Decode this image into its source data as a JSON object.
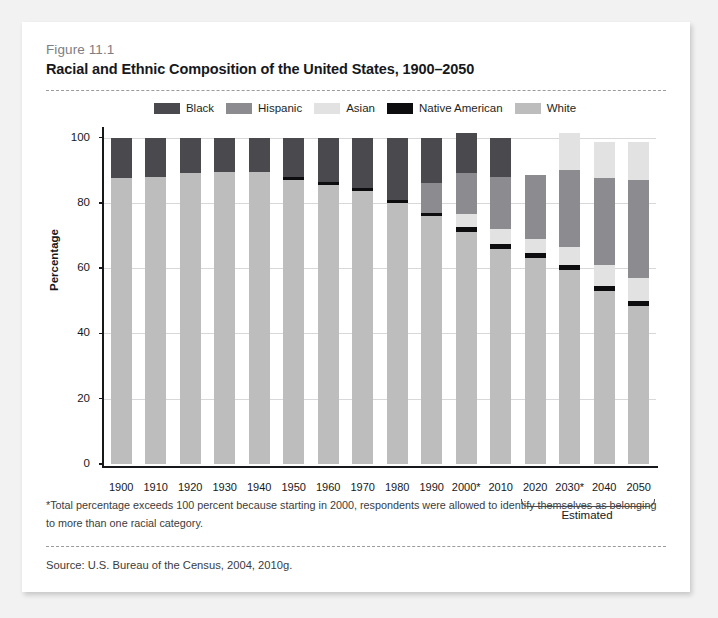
{
  "figure": {
    "number": "Figure 11.1",
    "title": "Racial and Ethnic Composition of the United States, 1900–2050"
  },
  "notes": {
    "footnote": "*Total percentage exceeds 100 percent because starting in 2000, respondents were allowed to identify themselves as belonging to more than one racial category.",
    "source": "Source: U.S. Bureau of the Census, 2004, 2010g."
  },
  "annotations": {
    "estimated_label": "Estimated"
  },
  "colors": {
    "black": "#4a4a4e",
    "hispanic": "#8c8c90",
    "asian": "#e2e2e2",
    "native_american": "#0d0d0f",
    "white": "#bdbdbd",
    "axis": "#16181c",
    "grid": "#d8d8da",
    "page_bg": "#f2f2f2",
    "card_bg": "#ffffff"
  },
  "chart_data": {
    "type": "bar",
    "stacked": true,
    "title": "Racial and Ethnic Composition of the United States, 1900–2050",
    "xlabel": "",
    "ylabel": "Percentage",
    "ylim": [
      0,
      100
    ],
    "yticks": [
      0,
      20,
      40,
      60,
      80,
      100
    ],
    "ytick_labels": [
      "0",
      "20",
      "40",
      "60",
      "80",
      "100"
    ],
    "grid": true,
    "legend_position": "top-center",
    "categories": [
      "1900",
      "1910",
      "1920",
      "1930",
      "1940",
      "1950",
      "1960",
      "1970",
      "1980",
      "1990",
      "2000*",
      "2010",
      "2020",
      "2030*",
      "2040",
      "2050"
    ],
    "estimated_categories": [
      "2020",
      "2030*",
      "2040",
      "2050"
    ],
    "series": [
      {
        "name": "White",
        "color": "#bdbdbd",
        "values": [
          87.5,
          88.0,
          89.0,
          89.5,
          89.5,
          87.0,
          85.5,
          83.5,
          80.0,
          76.0,
          71.0,
          66.0,
          63.0,
          59.5,
          53.0,
          48.5
        ]
      },
      {
        "name": "Native American",
        "color": "#0d0d0f",
        "values": [
          0,
          0,
          0,
          0,
          0,
          1.0,
          1.0,
          1.0,
          1.0,
          1.0,
          1.5,
          1.5,
          1.5,
          1.5,
          1.5,
          1.5
        ]
      },
      {
        "name": "Asian",
        "color": "#e2e2e2",
        "values": [
          0,
          0,
          0,
          0,
          0,
          0,
          0,
          0,
          0,
          0,
          4.0,
          4.5,
          4.5,
          5.5,
          6.5,
          7.0
        ]
      },
      {
        "name": "Hispanic",
        "color": "#8c8c90",
        "values": [
          0,
          0,
          0,
          0,
          0,
          0,
          0,
          0,
          0,
          9.0,
          12.5,
          16.0,
          19.5,
          23.5,
          26.5,
          30.0
        ]
      },
      {
        "name": "Black",
        "color": "#4a4a4e",
        "values": [
          12.5,
          12.0,
          11.0,
          10.5,
          10.5,
          12.0,
          13.5,
          15.5,
          19.0,
          14.0,
          12.5,
          12.0,
          0,
          0,
          0,
          0
        ]
      }
    ],
    "bars": [
      {
        "label": "1900",
        "total": 100.0,
        "estimated": false,
        "segments": [
          {
            "name": "White",
            "value": 87.5
          },
          {
            "name": "Black",
            "value": 12.5
          }
        ]
      },
      {
        "label": "1910",
        "total": 100.0,
        "estimated": false,
        "segments": [
          {
            "name": "White",
            "value": 88.0
          },
          {
            "name": "Black",
            "value": 12.0
          }
        ]
      },
      {
        "label": "1920",
        "total": 100.0,
        "estimated": false,
        "segments": [
          {
            "name": "White",
            "value": 89.0
          },
          {
            "name": "Black",
            "value": 11.0
          }
        ]
      },
      {
        "label": "1930",
        "total": 100.0,
        "estimated": false,
        "segments": [
          {
            "name": "White",
            "value": 89.5
          },
          {
            "name": "Black",
            "value": 10.5
          }
        ]
      },
      {
        "label": "1940",
        "total": 100.0,
        "estimated": false,
        "segments": [
          {
            "name": "White",
            "value": 89.5
          },
          {
            "name": "Black",
            "value": 10.5
          }
        ]
      },
      {
        "label": "1950",
        "total": 100.0,
        "estimated": false,
        "segments": [
          {
            "name": "White",
            "value": 87.0
          },
          {
            "name": "Native American",
            "value": 1.0
          },
          {
            "name": "Black",
            "value": 12.0
          }
        ]
      },
      {
        "label": "1960",
        "total": 100.0,
        "estimated": false,
        "segments": [
          {
            "name": "White",
            "value": 85.5
          },
          {
            "name": "Native American",
            "value": 1.0
          },
          {
            "name": "Black",
            "value": 13.5
          }
        ]
      },
      {
        "label": "1970",
        "total": 100.0,
        "estimated": false,
        "segments": [
          {
            "name": "White",
            "value": 83.5
          },
          {
            "name": "Native American",
            "value": 1.0
          },
          {
            "name": "Black",
            "value": 15.5
          }
        ]
      },
      {
        "label": "1980",
        "total": 100.0,
        "estimated": false,
        "segments": [
          {
            "name": "White",
            "value": 80.0
          },
          {
            "name": "Native American",
            "value": 1.0
          },
          {
            "name": "Black",
            "value": 19.0
          }
        ]
      },
      {
        "label": "1990",
        "total": 100.0,
        "estimated": false,
        "segments": [
          {
            "name": "White",
            "value": 76.0
          },
          {
            "name": "Native American",
            "value": 1.0
          },
          {
            "name": "Hispanic",
            "value": 9.0
          },
          {
            "name": "Black",
            "value": 14.0
          }
        ]
      },
      {
        "label": "2000*",
        "total": 101.5,
        "estimated": false,
        "segments": [
          {
            "name": "White",
            "value": 71.0
          },
          {
            "name": "Native American",
            "value": 1.5
          },
          {
            "name": "Asian",
            "value": 4.0
          },
          {
            "name": "Hispanic",
            "value": 12.5
          },
          {
            "name": "Black",
            "value": 12.5
          }
        ]
      },
      {
        "label": "2010",
        "total": 100.0,
        "estimated": false,
        "segments": [
          {
            "name": "White",
            "value": 66.0
          },
          {
            "name": "Native American",
            "value": 1.5
          },
          {
            "name": "Asian",
            "value": 4.5
          },
          {
            "name": "Hispanic",
            "value": 16.0
          },
          {
            "name": "Black",
            "value": 12.0
          }
        ]
      },
      {
        "label": "2020",
        "total": 88.5,
        "estimated": true,
        "segments": [
          {
            "name": "White",
            "value": 63.0
          },
          {
            "name": "Native American",
            "value": 1.5
          },
          {
            "name": "Asian",
            "value": 4.5
          },
          {
            "name": "Hispanic",
            "value": 19.5
          }
        ]
      },
      {
        "label": "2030*",
        "total": 101.5,
        "estimated": true,
        "segments": [
          {
            "name": "White",
            "value": 59.5
          },
          {
            "name": "Native American",
            "value": 1.5
          },
          {
            "name": "Asian",
            "value": 5.5
          },
          {
            "name": "Hispanic",
            "value": 23.5
          },
          {
            "name": "Asian",
            "value": 11.5
          }
        ]
      },
      {
        "label": "2040",
        "total": 98.5,
        "estimated": true,
        "segments": [
          {
            "name": "White",
            "value": 53.0
          },
          {
            "name": "Native American",
            "value": 1.5
          },
          {
            "name": "Asian",
            "value": 6.5
          },
          {
            "name": "Hispanic",
            "value": 26.5
          },
          {
            "name": "Asian",
            "value": 11.0
          }
        ]
      },
      {
        "label": "2050",
        "total": 98.5,
        "estimated": true,
        "segments": [
          {
            "name": "White",
            "value": 48.5
          },
          {
            "name": "Native American",
            "value": 1.5
          },
          {
            "name": "Asian",
            "value": 7.0
          },
          {
            "name": "Hispanic",
            "value": 30.0
          },
          {
            "name": "Asian",
            "value": 11.5
          }
        ]
      }
    ],
    "legend": [
      {
        "label": "Black",
        "color": "#4a4a4e"
      },
      {
        "label": "Hispanic",
        "color": "#8c8c90"
      },
      {
        "label": "Asian",
        "color": "#e2e2e2"
      },
      {
        "label": "Native American",
        "color": "#0d0d0f"
      },
      {
        "label": "White",
        "color": "#bdbdbd"
      }
    ]
  }
}
